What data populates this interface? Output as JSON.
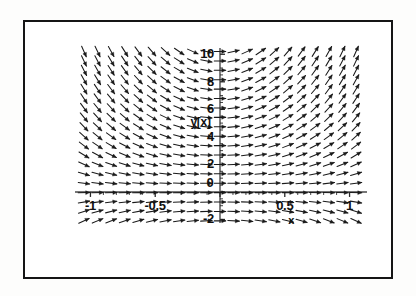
{
  "figure": {
    "kind": "direction-field-plot",
    "background_color": "#ffffff",
    "frame_color": "#151515",
    "ink_color": "#111111"
  },
  "chart_data": {
    "type": "scatter",
    "subtype": "direction-field",
    "title": "",
    "subtitle": "",
    "xlabel": "x",
    "ylabel": "y[x]",
    "xlim": [
      -1.15,
      1.15
    ],
    "ylim": [
      -2.4,
      10.6
    ],
    "grid": false,
    "legend": null,
    "legend_position": "none",
    "axes_style": "crossed-axes-at-origin",
    "x_ticks_major": [
      -1,
      -0.5,
      0,
      0.5,
      1
    ],
    "x_tick_labels": [
      "-1",
      "-0.5",
      "0",
      "0.5",
      "1"
    ],
    "x_ticks_minor_step": 0.1,
    "y_ticks_major": [
      -2,
      0,
      2,
      4,
      6,
      8,
      10
    ],
    "y_tick_labels": [
      "-2",
      "0",
      "2",
      "4",
      "6",
      "8",
      "10"
    ],
    "y_ticks_minor_step": 0.5,
    "slope_function": "dy/dx = 2*x*y",
    "arrow_color": "#1a1a1a",
    "arrow_head": "filled-triangle",
    "grid_nx": 21,
    "grid_ny": 19,
    "x_sample_min": -1.05,
    "x_sample_max": 1.05,
    "y_sample_min": -2.1,
    "y_sample_max": 10.2,
    "note": "Slope field: arrows horizontal along x=0 and along y=0; steep down-right in upper-left quadrant, steep up-right in upper-right quadrant, mildly up-right below the x-axis on the left."
  },
  "labels": {
    "y_axis_name": "y[x]",
    "x_axis_name": "x",
    "x_tick_neg_one": "-1",
    "x_tick_neg_half": "-0.5",
    "x_tick_zero": "0",
    "x_tick_half": "0.5",
    "x_tick_one": "1",
    "y_tick_ten": "10",
    "y_tick_eight": "8",
    "y_tick_six": "6",
    "y_tick_four": "4",
    "y_tick_two": "2",
    "y_tick_neg_two": "-2"
  }
}
